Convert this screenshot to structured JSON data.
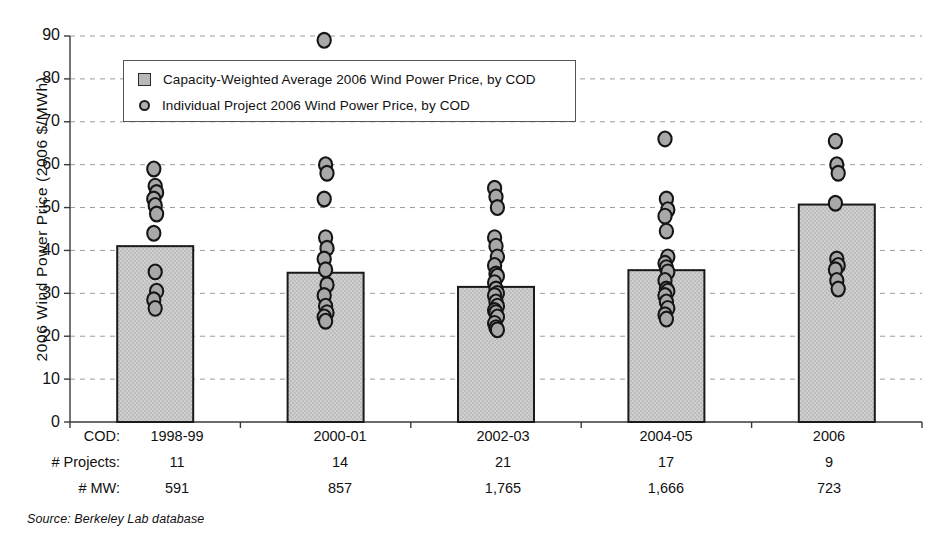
{
  "chart_data": {
    "type": "bar",
    "title": "",
    "xlabel": "COD",
    "ylabel": "2006 Wind Power Price (2006 $/MWh)",
    "ylim": [
      0,
      90
    ],
    "yticks": [
      0,
      10,
      20,
      30,
      40,
      50,
      60,
      70,
      80,
      90
    ],
    "grid": true,
    "legend_position": "upper-left-inside",
    "categories": [
      "1998-99",
      "2000-01",
      "2002-03",
      "2004-05",
      "2006"
    ],
    "values": [
      41.0,
      34.8,
      31.5,
      35.4,
      50.7
    ],
    "series": [
      {
        "name": "Capacity-Weighted Average 2006 Wind Power Price, by COD",
        "type": "bar",
        "values": [
          41.0,
          34.8,
          31.5,
          35.4,
          50.7
        ]
      },
      {
        "name": "Individual Project 2006 Wind Power Price, by COD",
        "type": "scatter",
        "points_by_category": {
          "1998-99": [
            59.0,
            55.0,
            53.5,
            52.0,
            50.5,
            48.5,
            44.0,
            35.0,
            30.5,
            28.5,
            26.5
          ],
          "2000-01": [
            89.0,
            60.0,
            58.0,
            52.0,
            43.0,
            40.5,
            38.0,
            35.5,
            32.0,
            29.5,
            27.0,
            25.5,
            24.5,
            23.5
          ],
          "2002-03": [
            54.5,
            52.5,
            50.0,
            43.0,
            41.0,
            38.5,
            36.5,
            34.5,
            32.5,
            31.0,
            29.5,
            28.0,
            27.0,
            25.5,
            24.5,
            23.0,
            22.0,
            21.5,
            34.0,
            30.0,
            26.0
          ],
          "2004-05": [
            66.0,
            52.0,
            49.5,
            48.0,
            44.5,
            38.5,
            37.0,
            35.0,
            33.0,
            31.0,
            29.5,
            28.0,
            26.5,
            25.0,
            24.0,
            36.0,
            30.5
          ],
          "2006": [
            65.5,
            60.0,
            58.0,
            51.0,
            38.0,
            35.5,
            33.0,
            31.0,
            36.5
          ]
        }
      }
    ]
  },
  "legend": {
    "items": [
      {
        "marker": "square",
        "label": "Capacity-Weighted Average 2006 Wind Power Price, by COD"
      },
      {
        "marker": "circle",
        "label": "Individual Project 2006 Wind Power Price, by COD"
      }
    ]
  },
  "axis": {
    "y_title": "2006 Wind Power Price (2006 $/MWh)",
    "y_ticks": [
      "90",
      "80",
      "70",
      "60",
      "50",
      "40",
      "30",
      "20",
      "10",
      "0"
    ]
  },
  "category_table": {
    "rows": [
      {
        "header": "COD:",
        "cells": [
          "1998-99",
          "2000-01",
          "2002-03",
          "2004-05",
          "2006"
        ]
      },
      {
        "header": "# Projects:",
        "cells": [
          "11",
          "14",
          "21",
          "17",
          "9"
        ]
      },
      {
        "header": "# MW:",
        "cells": [
          "591",
          "857",
          "1,765",
          "1,666",
          "723"
        ]
      }
    ]
  },
  "source": {
    "text": "Source: Berkeley Lab database"
  },
  "colors": {
    "bar_fill": "#bdbdbd",
    "bar_stroke": "#1a1a1a",
    "marker_fill": "#a8a8a8",
    "marker_stroke": "#151515",
    "grid": "#9a9aa5",
    "axis": "#3a3a3a"
  }
}
